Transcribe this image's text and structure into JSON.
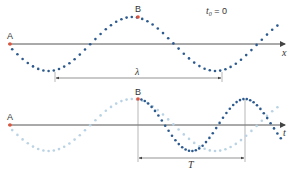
{
  "top_panel": {
    "point_a_label": "A",
    "point_b_label": "B",
    "time_label": "t",
    "time_sub": "0",
    "time_eq": " = 0",
    "axis_label": "x",
    "span_label": "λ",
    "wave": {
      "x0": 10,
      "axis_y": 44,
      "amplitude": 27,
      "wavelength": 167,
      "phase": "minus-sine",
      "x_end": 280,
      "dot_step": 5.2
    },
    "span": {
      "x1": 55,
      "x2": 222,
      "y": 78
    }
  },
  "bottom_panel": {
    "point_a_label": "A",
    "point_b_label": "B",
    "axis_label": "t",
    "span_label": "T",
    "faded_wave": {
      "x0": 10,
      "axis_y": 125,
      "amplitude": 26,
      "wavelength": 167,
      "x_end": 280
    },
    "dark_wave": {
      "x0": 138,
      "axis_y": 125,
      "amplitude": 26,
      "period": 107,
      "x_end": 282
    },
    "span": {
      "x1": 138,
      "x2": 245,
      "y": 158
    }
  },
  "colors": {
    "dot": "#2c5a8f",
    "dot_faded": "#b9d3e4",
    "marker": "#e0523a",
    "axis": "#555555",
    "guide": "#888888"
  }
}
